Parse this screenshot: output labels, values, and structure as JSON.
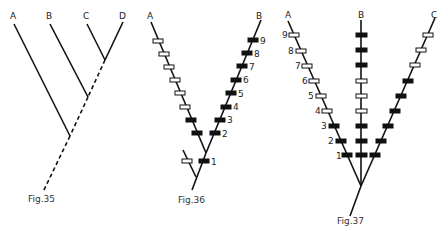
{
  "figures": {
    "fig35": {
      "caption": "Fig.35",
      "taxa": [
        "A",
        "B",
        "C",
        "D"
      ]
    },
    "fig36": {
      "caption": "Fig.36",
      "taxa": [
        "A",
        "B"
      ],
      "character_numbers": [
        "1",
        "2",
        "3",
        "4",
        "5",
        "6",
        "7",
        "8",
        "9"
      ]
    },
    "fig37": {
      "caption": "Fig.37",
      "taxa": [
        "A",
        "B",
        "C"
      ],
      "character_numbers": [
        "1",
        "2",
        "3",
        "4",
        "5",
        "6",
        "7",
        "8",
        "9"
      ]
    }
  },
  "legend": {
    "filled_bar": "derived character state",
    "open_bar": "primitive character state"
  },
  "colors": {
    "ink": "#111111",
    "background": "#ffffff"
  }
}
